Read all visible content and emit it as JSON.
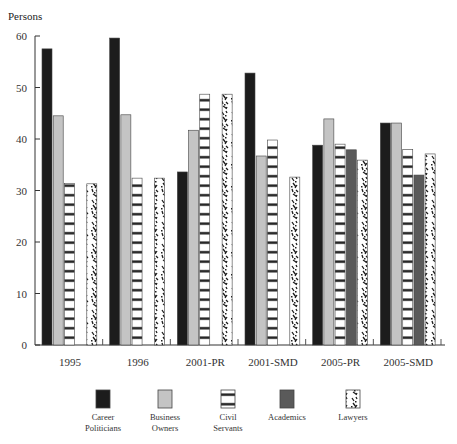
{
  "chart_data": {
    "type": "bar",
    "title": "",
    "ylabel": "Persons",
    "xlabel": "",
    "ylim": [
      0,
      60
    ],
    "yticks": [
      0,
      10,
      20,
      30,
      40,
      50,
      60
    ],
    "grid": false,
    "legend_position": "bottom",
    "categories": [
      "1995",
      "1996",
      "2001-PR",
      "2001-SMD",
      "2005-PR",
      "2005-SMD"
    ],
    "series": [
      {
        "name": "Career Politicians",
        "label_lines": [
          "Career",
          "Politicians"
        ],
        "pattern": "solid-black",
        "color": "#1c1c1c",
        "values": [
          57.5,
          59.6,
          33.6,
          52.8,
          38.8,
          43.1
        ]
      },
      {
        "name": "Business Owners",
        "label_lines": [
          "Business",
          "Owners"
        ],
        "pattern": "solid-lightgray",
        "color": "#c4c4c4",
        "values": [
          44.5,
          44.7,
          41.7,
          36.7,
          43.9,
          43.1
        ]
      },
      {
        "name": "Civil Servants",
        "label_lines": [
          "Civil",
          "Servants"
        ],
        "pattern": "horizontal-stripes",
        "color": "#1c1c1c",
        "values": [
          31.4,
          32.4,
          48.7,
          39.8,
          39.0,
          38.0
        ]
      },
      {
        "name": "Academics",
        "label_lines": [
          "Academics"
        ],
        "pattern": "solid-darkgray",
        "color": "#5a5a5a",
        "values": [
          0,
          0,
          0,
          0,
          37.9,
          33.0
        ]
      },
      {
        "name": "Lawyers",
        "label_lines": [
          "Lawyers"
        ],
        "pattern": "speckle",
        "color": "#1c1c1c",
        "values": [
          31.3,
          32.4,
          48.7,
          32.6,
          35.9,
          37.1
        ]
      }
    ]
  }
}
